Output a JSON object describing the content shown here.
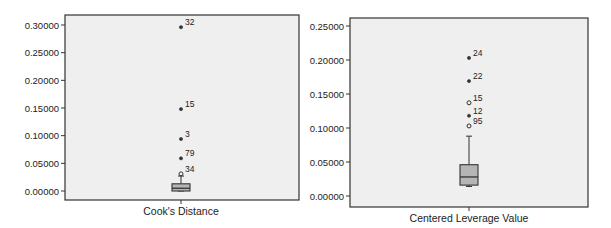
{
  "chart_data": [
    {
      "type": "box",
      "title": "",
      "xlabel": "Cook's Distance",
      "ylabel": "",
      "ylim": [
        0,
        0.3
      ],
      "yticks": [
        0.0,
        0.05,
        0.1,
        0.15,
        0.2,
        0.25,
        0.3
      ],
      "ytick_labels": [
        "0.00000",
        "0.05000",
        "0.10000",
        "0.15000",
        "0.20000",
        "0.25000",
        "0.30000"
      ],
      "grid": false,
      "box": {
        "whisker_low": 0.0,
        "q1": 0.0,
        "median": 0.005,
        "q3": 0.013,
        "whisker_high": 0.027
      },
      "outliers": [
        {
          "label": "34",
          "value": 0.031,
          "kind": "mild"
        },
        {
          "label": "79",
          "value": 0.059,
          "kind": "extreme"
        },
        {
          "label": "3",
          "value": 0.094,
          "kind": "extreme"
        },
        {
          "label": "15",
          "value": 0.148,
          "kind": "extreme"
        },
        {
          "label": "32",
          "value": 0.296,
          "kind": "extreme"
        }
      ]
    },
    {
      "type": "box",
      "title": "",
      "xlabel": "Centered Leverage Value",
      "ylabel": "",
      "ylim": [
        0,
        0.25
      ],
      "yticks": [
        0.0,
        0.05,
        0.1,
        0.15,
        0.2,
        0.25
      ],
      "ytick_labels": [
        "0.00000",
        "0.05000",
        "0.10000",
        "0.15000",
        "0.20000",
        "0.25000"
      ],
      "grid": false,
      "box": {
        "whisker_low": 0.014,
        "q1": 0.016,
        "median": 0.028,
        "q3": 0.046,
        "whisker_high": 0.088
      },
      "outliers": [
        {
          "label": "95",
          "value": 0.103,
          "kind": "mild"
        },
        {
          "label": "12",
          "value": 0.118,
          "kind": "extreme"
        },
        {
          "label": "15",
          "value": 0.137,
          "kind": "mild"
        },
        {
          "label": "22",
          "value": 0.169,
          "kind": "extreme"
        },
        {
          "label": "24",
          "value": 0.203,
          "kind": "extreme"
        }
      ]
    }
  ],
  "layout": {
    "charts": [
      {
        "frame": {
          "x": 65,
          "y": 15,
          "w": 234,
          "h": 185
        },
        "y0_px": 191,
        "ymax_px": 25,
        "center_x": 181
      },
      {
        "frame": {
          "x": 350,
          "y": 18,
          "w": 238,
          "h": 189
        },
        "y0_px": 196,
        "ymax_px": 26,
        "center_x": 469
      }
    ],
    "colors": {
      "plot_bg": "#efefef",
      "frame": "#333333",
      "box_fill": "#b5b5b5",
      "stroke": "#333333"
    }
  }
}
